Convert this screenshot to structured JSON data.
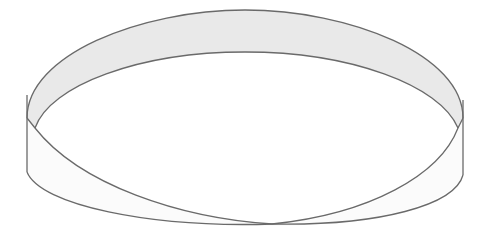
{
  "figure": {
    "colors": {
      "background": "#ffffff",
      "band_top_fill": "#e9e9e9",
      "band_bottom_fill": "#fafafa",
      "stroke": "#6a6a6a"
    }
  }
}
